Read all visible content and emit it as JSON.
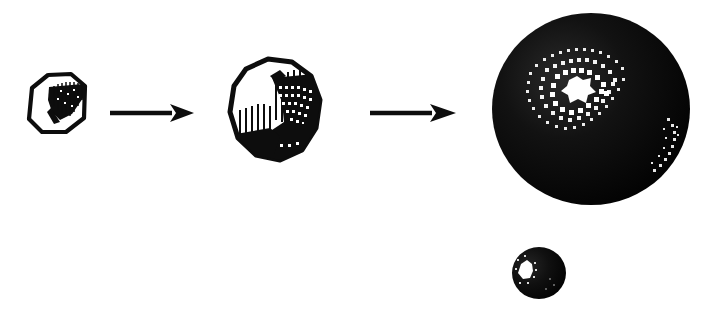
{
  "figure": {
    "background_color": "#ffffff",
    "ink_color": "#0d0d0d",
    "style": "black-and-white halftone / dithered line art",
    "canvas": {
      "width": 709,
      "height": 314
    }
  },
  "sequence": {
    "direction": "left-to-right",
    "step_count": 3,
    "connector_count": 2,
    "steps": [
      {
        "index": 1,
        "name": "faceted-cube",
        "semantic": "coarse low-polygon cube outline with hatched shaded face",
        "fill": "outline only, dark hatched wedge inside",
        "center": {
          "x": 60,
          "y": 107
        },
        "size": {
          "width": 62,
          "height": 60
        },
        "outline_sides": 6,
        "shading": "hatched"
      },
      {
        "index": 2,
        "name": "rounded-polygon-blob",
        "semantic": "medium tessellation rounded blob with comb-hatched shading",
        "fill": "outline with dithered dark region lower-right",
        "center": {
          "x": 280,
          "y": 112
        },
        "size": {
          "width": 118,
          "height": 120
        },
        "outline_sides": 9,
        "shading": "comb hatch + halftone dots"
      },
      {
        "index": 3,
        "name": "shaded-sphere-large",
        "semantic": "smooth fully shaded sphere with dithered specular highlight",
        "fill": "solid black with halftone highlight",
        "center": {
          "x": 591,
          "y": 109
        },
        "size": {
          "width": 198,
          "height": 192
        },
        "outline_sides": 0,
        "shading": "solid with dithered specular highlight and rim light"
      }
    ],
    "extra": {
      "index": 4,
      "name": "shaded-sphere-small",
      "semantic": "small companion sphere below the large sphere",
      "center": {
        "x": 539,
        "y": 273
      },
      "size": {
        "width": 52,
        "height": 50
      },
      "shading": "solid with small white highlight on left"
    },
    "connectors": [
      {
        "index": 1,
        "name": "arrow-right-1",
        "glyph": "→",
        "from_step": 1,
        "to_step": 2,
        "start": {
          "x": 112,
          "y": 113
        },
        "end": {
          "x": 192,
          "y": 113
        }
      },
      {
        "index": 2,
        "name": "arrow-right-2",
        "glyph": "→",
        "from_step": 2,
        "to_step": 3,
        "start": {
          "x": 372,
          "y": 113
        },
        "end": {
          "x": 456,
          "y": 113
        }
      }
    ]
  },
  "colors": {
    "ink": "#0d0d0d",
    "paper": "#ffffff",
    "highlight": "#ffffff"
  }
}
